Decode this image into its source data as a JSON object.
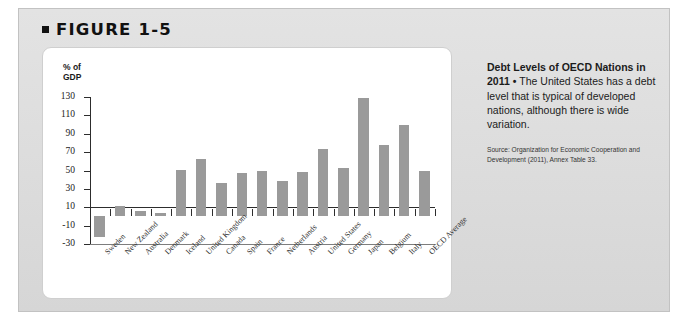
{
  "figure": {
    "label": "FIGURE 1-5",
    "bullet_icon": "square-bullet-icon"
  },
  "caption": {
    "lead": "Debt Levels of OECD Nations in 2011",
    "separator": " • ",
    "body": "The United States has a debt level that is typical of developed nations, although there is wide variation.",
    "source": "Source: Organization for Economic Cooperation and Development (2011), Annex Table 33."
  },
  "chart_data": {
    "type": "bar",
    "title": "",
    "xlabel": "",
    "ylabel": "% of GDP",
    "ylim": [
      -30,
      130
    ],
    "yticks": [
      130,
      110,
      90,
      70,
      50,
      30,
      10,
      -10,
      -30
    ],
    "ytick_labels": [
      "130",
      "110",
      "90",
      "70",
      "50",
      "30",
      "10",
      "-10",
      "-30"
    ],
    "grid": false,
    "legend": false,
    "bar_color": "#9a9a9a",
    "axis_color": "#2d2d2d",
    "categories": [
      "Sweden",
      "New Zealand",
      "Australia",
      "Denmark",
      "Iceland",
      "United Kingdom",
      "Canada",
      "Spain",
      "France",
      "Netherlands",
      "Austria",
      "United States",
      "Germany",
      "Japan",
      "Belgium",
      "Italy",
      "OECD Average"
    ],
    "values": [
      -22,
      11,
      6,
      4,
      51,
      62,
      36,
      47,
      50,
      39,
      48,
      73,
      53,
      129,
      78,
      100,
      50
    ]
  }
}
